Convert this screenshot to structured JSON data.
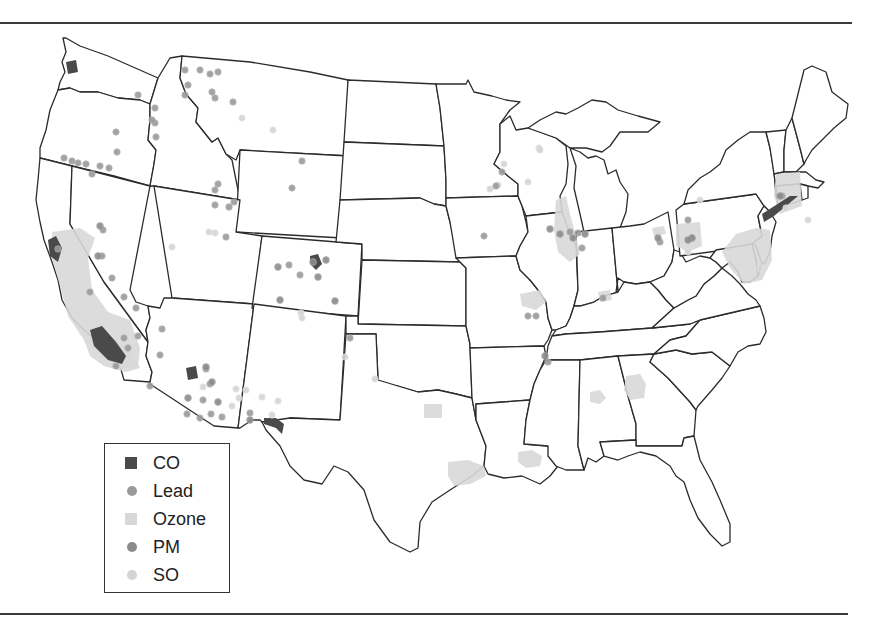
{
  "figure": {
    "type": "map",
    "region": "Contiguous United States"
  },
  "legend": {
    "items": [
      {
        "key": "CO",
        "label": "CO",
        "shape": "square",
        "color": "#4a4a4a"
      },
      {
        "key": "Lead",
        "label": "Lead",
        "shape": "circle",
        "color": "#9a9a9a"
      },
      {
        "key": "Ozone",
        "label": "Ozone",
        "shape": "square",
        "color": "#d8d8d8"
      },
      {
        "key": "PM",
        "label": "PM",
        "shape": "circle",
        "color": "#8a8a8a"
      },
      {
        "key": "SO",
        "label": "SO",
        "shape": "circle",
        "color": "#d4d4d4"
      }
    ]
  },
  "colors": {
    "CO": "#4a4a4a",
    "Lead": "#9a9a9a",
    "Ozone": "#d8d8d8",
    "PM": "#8a8a8a",
    "SO": "#d4d4d4",
    "state_stroke": "#2b2b2b",
    "rule": "#3a3a3a"
  },
  "ozone_areas": [
    {
      "name": "California Central Valley / Bay Area",
      "path": "M52,232 L80,228 L95,238 L88,258 L92,290 L108,312 L130,320 L140,348 L138,368 L118,368 L98,352 L84,340 L68,316 L60,286 L52,258 Z"
    },
    {
      "name": "Southern California",
      "path": "M84,340 L112,338 L132,352 L140,368 L126,372 L104,366 L90,356 Z"
    },
    {
      "name": "Houston",
      "path": "M448,462 L468,460 L484,466 L486,476 L470,484 L454,486 L448,476 Z"
    },
    {
      "name": "Dallas",
      "path": "M424,404 L442,404 L442,418 L424,418 Z"
    },
    {
      "name": "Baton Rouge",
      "path": "M518,452 L532,450 L542,456 L540,466 L526,468 L518,462 Z"
    },
    {
      "name": "Atlanta",
      "path": "M626,376 L640,374 L646,384 L644,398 L630,400 L624,390 Z"
    },
    {
      "name": "Birmingham",
      "path": "M590,392 L600,390 L606,398 L600,404 L590,402 Z"
    },
    {
      "name": "Chicago / Milwaukee",
      "path": "M556,200 L566,196 L570,214 L576,236 L580,254 L570,262 L558,252 L554,230 Z"
    },
    {
      "name": "St. Louis",
      "path": "M520,294 L540,290 L546,302 L536,310 L522,306 Z"
    },
    {
      "name": "Louisville",
      "path": "M598,292 L610,290 L612,300 L600,302 Z"
    },
    {
      "name": "Pennsylvania",
      "path": "M676,224 L700,222 L702,246 L688,252 L676,246 Z"
    },
    {
      "name": "Philadelphia / Baltimore / DC",
      "path": "M736,234 L756,228 L770,230 L772,260 L762,280 L744,284 L730,268 L722,252 Z"
    },
    {
      "name": "Connecticut / Massachusetts",
      "path": "M776,174 L800,172 L802,206 L780,214 L774,196 Z"
    },
    {
      "name": "Ohio",
      "path": "M652,228 L664,226 L666,234 L654,236 Z"
    }
  ],
  "co_areas": [
    {
      "name": "San Francisco",
      "path": "M48,240 L56,236 L62,248 L58,262 L50,256 Z"
    },
    {
      "name": "Los Angeles",
      "path": "M90,330 L102,326 L116,342 L126,356 L122,364 L108,360 L94,346 Z"
    },
    {
      "name": "Phoenix",
      "path": "M186,368 L196,366 L198,378 L188,380 Z"
    },
    {
      "name": "El Paso",
      "path": "M264,418 L276,418 L284,424 L282,434 L276,428 L264,424 Z"
    },
    {
      "name": "Denver",
      "path": "M310,256 L318,254 L322,264 L316,270 L310,264 Z"
    },
    {
      "name": "Seattle",
      "path": "M66,62 L76,60 L78,72 L68,74 Z"
    },
    {
      "name": "New York",
      "path": "M762,214 L790,196 L798,196 L774,216 L764,222 Z"
    }
  ],
  "points": {
    "Lead": [
      [
        64,
        158
      ],
      [
        72,
        161
      ],
      [
        78,
        163
      ],
      [
        86,
        164
      ],
      [
        100,
        166
      ],
      [
        109,
        168
      ],
      [
        117,
        152
      ],
      [
        138,
        95
      ],
      [
        155,
        123
      ],
      [
        155,
        108
      ],
      [
        116,
        132
      ],
      [
        156,
        137
      ],
      [
        92,
        174
      ],
      [
        152,
        120
      ],
      [
        185,
        70
      ],
      [
        200,
        70
      ],
      [
        210,
        74
      ],
      [
        218,
        72
      ],
      [
        188,
        85
      ],
      [
        212,
        92
      ],
      [
        215,
        98
      ],
      [
        185,
        95
      ],
      [
        233,
        102
      ],
      [
        215,
        190
      ],
      [
        218,
        184
      ],
      [
        215,
        205
      ],
      [
        226,
        237
      ],
      [
        229,
        207
      ],
      [
        234,
        202
      ],
      [
        292,
        188
      ],
      [
        302,
        161
      ],
      [
        300,
        275
      ],
      [
        289,
        265
      ],
      [
        350,
        338
      ],
      [
        484,
        236
      ],
      [
        496,
        186
      ],
      [
        502,
        172
      ],
      [
        570,
        232
      ],
      [
        578,
        233
      ],
      [
        660,
        242
      ],
      [
        582,
        248
      ],
      [
        528,
        316
      ],
      [
        536,
        316
      ],
      [
        548,
        362
      ],
      [
        603,
        298
      ],
      [
        206,
        369
      ],
      [
        210,
        384
      ],
      [
        203,
        400
      ],
      [
        211,
        414
      ],
      [
        200,
        418
      ],
      [
        187,
        414
      ],
      [
        150,
        386
      ],
      [
        90,
        292
      ],
      [
        124,
        297
      ],
      [
        136,
        308
      ],
      [
        116,
        366
      ],
      [
        124,
        338
      ],
      [
        112,
        278
      ],
      [
        58,
        249
      ],
      [
        103,
        230
      ],
      [
        102,
        256
      ],
      [
        138,
        336
      ],
      [
        128,
        348
      ],
      [
        162,
        329
      ],
      [
        160,
        355
      ],
      [
        250,
        413
      ],
      [
        222,
        417
      ],
      [
        692,
        238
      ],
      [
        782,
        196
      ],
      [
        688,
        220
      ]
    ],
    "PM": [
      [
        100,
        226
      ],
      [
        98,
        256
      ],
      [
        280,
        300
      ],
      [
        250,
        420
      ],
      [
        212,
        382
      ],
      [
        206,
        367
      ],
      [
        278,
        267
      ],
      [
        318,
        277
      ],
      [
        326,
        260
      ],
      [
        335,
        301
      ],
      [
        313,
        262
      ],
      [
        550,
        229
      ],
      [
        560,
        234
      ],
      [
        573,
        238
      ],
      [
        585,
        234
      ],
      [
        545,
        356
      ],
      [
        780,
        196
      ],
      [
        692,
        238
      ],
      [
        688,
        240
      ],
      [
        658,
        238
      ],
      [
        188,
        398
      ],
      [
        218,
        402
      ]
    ],
    "SO": [
      [
        172,
        247
      ],
      [
        209,
        232
      ],
      [
        215,
        233
      ],
      [
        229,
        207
      ],
      [
        203,
        387
      ],
      [
        239,
        398
      ],
      [
        246,
        390
      ],
      [
        262,
        397
      ],
      [
        301,
        313
      ],
      [
        302,
        318
      ],
      [
        345,
        357
      ],
      [
        375,
        379
      ],
      [
        272,
        415
      ],
      [
        278,
        401
      ],
      [
        232,
        406
      ],
      [
        236,
        389
      ],
      [
        539,
        148
      ],
      [
        504,
        164
      ],
      [
        528,
        182
      ],
      [
        242,
        118
      ],
      [
        273,
        130
      ],
      [
        490,
        189
      ],
      [
        498,
        185
      ],
      [
        540,
        150
      ],
      [
        700,
        200
      ],
      [
        688,
        252
      ],
      [
        760,
        268
      ],
      [
        786,
        208
      ],
      [
        808,
        220
      ]
    ]
  }
}
